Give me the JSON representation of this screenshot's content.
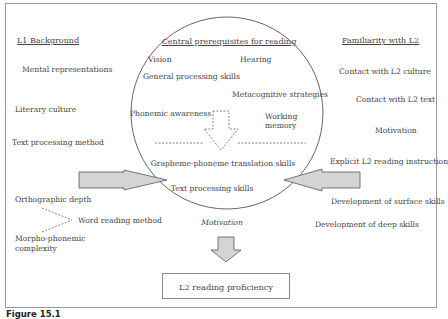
{
  "figure": {
    "caption": "Figure 15.1",
    "output_box": "L2 reading proficiency"
  },
  "left_column": {
    "heading": "L1 Background",
    "items": [
      "Mental representations",
      "Literary culture",
      "Text processing method"
    ],
    "orthographic_depth": "Orthographic depth",
    "morpho_phonemic": [
      "Morpho-phonemic",
      "complexity"
    ],
    "word_reading_method": "Word reading method"
  },
  "center": {
    "heading": "Central prerequisites for reading",
    "vision": "Vision",
    "hearing": "Hearing",
    "general_processing": "General processing skills",
    "metacognitive": "Metacognitive strategies",
    "phonemic": "Phonemic awareness",
    "working_memory": [
      "Working",
      "memory"
    ],
    "grapheme_phoneme": "Grapheme-phoneme translation skills",
    "text_processing": "Text processing skills",
    "motivation": "Motivation"
  },
  "right_column": {
    "heading": "Familiarity with L2",
    "items": [
      "Contact with L2 culture",
      "Contact with L2 text",
      "Motivation",
      "Explicit L2 reading instruction",
      "Development of surface skills",
      "Development of deep skills"
    ]
  },
  "colors": {
    "arrow_fill": "#d4d4d4",
    "line": "#555555",
    "frame": "#9a9a9a"
  }
}
